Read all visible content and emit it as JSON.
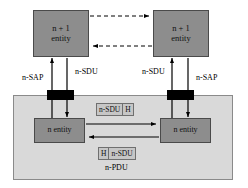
{
  "diagram": {
    "colors": {
      "entity_fill": "#8d8d8d",
      "layer_fill": "#d9d9d9",
      "sap_fill": "#000000",
      "pdu_fill": "#c6c6c6",
      "line": "#000000",
      "background": "#ffffff"
    },
    "upper_entities": [
      {
        "line1": "n + 1",
        "line2": "entity"
      },
      {
        "line1": "n + 1",
        "line2": "entity"
      }
    ],
    "lower_entities": [
      {
        "label": "n entity"
      },
      {
        "label": "n entity"
      }
    ],
    "sap_labels": [
      {
        "text": "n-SAP"
      },
      {
        "text": "n-SAP"
      }
    ],
    "sdu_labels": [
      {
        "text": "n-SDU"
      },
      {
        "text": "n-SDU"
      }
    ],
    "pdu_top": {
      "cells": [
        "n-SDU",
        "H"
      ]
    },
    "pdu_bottom": {
      "cells": [
        "H",
        "n-SDU"
      ]
    },
    "pdu_label": "n-PDU"
  }
}
